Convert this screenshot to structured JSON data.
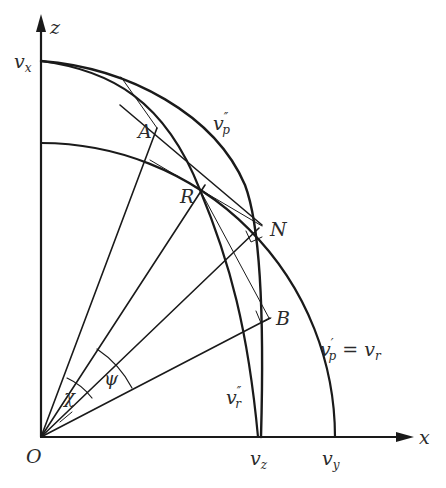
{
  "diagram": {
    "axes": {
      "x_label": "x",
      "z_label": "z",
      "origin_label": "O"
    },
    "points": {
      "A": "A",
      "R": "R",
      "N": "N",
      "B": "B"
    },
    "curves": {
      "v_x": "v",
      "v_x_sub": "x",
      "v_p_dd": "v",
      "v_p_dd_sub": "p",
      "v_p_dd_sup": "″",
      "v_p_prime": "v",
      "v_p_prime_sub": "p",
      "v_p_prime_sup": "′",
      "v_p_prime_eq": " = v",
      "v_p_prime_eq_sub": "r",
      "v_r_dd": "v",
      "v_r_dd_sub": "r",
      "v_r_dd_sup": "″",
      "v_z": "v",
      "v_z_sub": "z",
      "v_y": "v",
      "v_y_sub": "y"
    },
    "angles": {
      "chi": "χ",
      "psi": "ψ"
    },
    "caption_fragment": "…"
  }
}
